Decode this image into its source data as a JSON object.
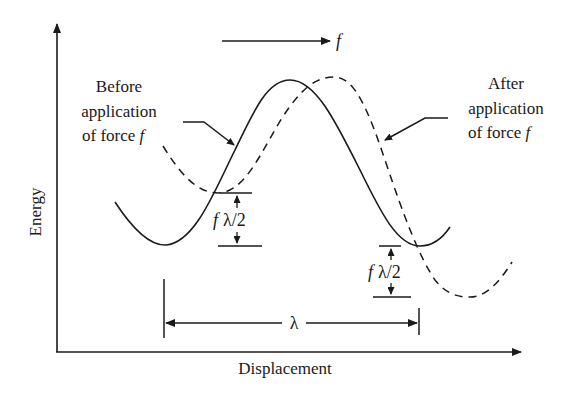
{
  "diagram": {
    "type": "energy-landscape",
    "axes": {
      "y_label": "Energy",
      "x_label": "Displacement"
    },
    "force_arrow": {
      "label": "f"
    },
    "labels": {
      "before": {
        "line1": "Before",
        "line2": "application",
        "line3_prefix": "of force ",
        "line3_var": "f"
      },
      "after": {
        "line1": "After",
        "line2": "application",
        "line3_prefix": "of force ",
        "line3_var": "f"
      }
    },
    "annotations": {
      "left_drop": {
        "var": "f",
        "expr": "λ/2"
      },
      "right_drop": {
        "var": "f",
        "expr": "λ/2"
      },
      "period": "λ"
    },
    "curves": [
      {
        "name": "Before application of force f",
        "style": "solid"
      },
      {
        "name": "After application of force f",
        "style": "dashed"
      }
    ],
    "colors": {
      "ink": "#1a1a1a",
      "background": "#ffffff"
    }
  }
}
